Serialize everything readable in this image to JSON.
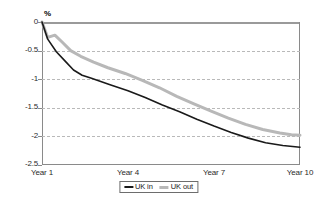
{
  "chart_data": {
    "type": "line",
    "title": "",
    "xlabel": "",
    "ylabel": "%",
    "ylim": [
      -2.5,
      0
    ],
    "xlim": [
      1,
      10
    ],
    "grid": true,
    "grid_axis": "y",
    "legend_position": "bottom-center",
    "ytick_labels": [
      "0",
      "-0.5",
      "-1",
      "-1.5",
      "-2",
      "-2.5"
    ],
    "ytick_values": [
      0,
      -0.5,
      -1,
      -1.5,
      -2,
      -2.5
    ],
    "xtick_labels": [
      "Year 1",
      "Year 4",
      "Year 7",
      "Year 10"
    ],
    "xtick_values": [
      1,
      4,
      7,
      10
    ],
    "series": [
      {
        "name": "UK in",
        "color": "#1a1a1a",
        "x": [
          1.0,
          1.2,
          1.5,
          1.8,
          2.1,
          2.4,
          2.7,
          3.0,
          3.4,
          4.0,
          4.6,
          5.2,
          5.8,
          6.4,
          7.0,
          7.6,
          8.2,
          8.8,
          9.4,
          10.0
        ],
        "values": [
          0.0,
          -0.3,
          -0.52,
          -0.68,
          -0.84,
          -0.93,
          -0.98,
          -1.03,
          -1.1,
          -1.2,
          -1.32,
          -1.45,
          -1.57,
          -1.7,
          -1.82,
          -1.93,
          -2.03,
          -2.11,
          -2.16,
          -2.19
        ]
      },
      {
        "name": "UK out",
        "color": "#b8b8b8",
        "x": [
          1.0,
          1.2,
          1.45,
          1.7,
          2.0,
          2.35,
          2.8,
          3.3,
          3.9,
          4.5,
          5.1,
          5.7,
          6.3,
          6.9,
          7.5,
          8.1,
          8.7,
          9.3,
          9.7,
          10.0
        ],
        "values": [
          0.0,
          -0.27,
          -0.23,
          -0.35,
          -0.5,
          -0.6,
          -0.7,
          -0.8,
          -0.9,
          -1.02,
          -1.15,
          -1.3,
          -1.43,
          -1.56,
          -1.68,
          -1.79,
          -1.88,
          -1.94,
          -1.97,
          -1.98
        ]
      }
    ],
    "legend": [
      {
        "label": "UK in",
        "color": "#1a1a1a",
        "style": "thin-line"
      },
      {
        "label": "UK out",
        "color": "#b8b8b8",
        "style": "thick-line"
      }
    ]
  }
}
